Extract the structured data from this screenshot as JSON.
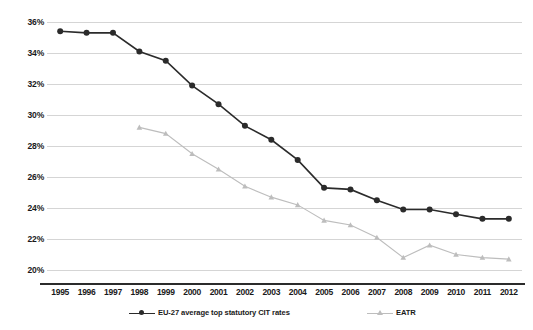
{
  "chart_data": {
    "type": "line",
    "title": "",
    "subtitle": "",
    "xlabel": "",
    "ylabel": "",
    "grid": true,
    "legend_position": "bottom",
    "ylim": [
      20,
      36
    ],
    "ytick_values": [
      36,
      34,
      32,
      30,
      28,
      26,
      24,
      22,
      20
    ],
    "ytick_labels": [
      "36%",
      "34%",
      "32%",
      "30%",
      "28%",
      "26%",
      "24%",
      "22%",
      "20%"
    ],
    "categories": [
      "1995",
      "1996",
      "1997",
      "1998",
      "1999",
      "2000",
      "2001",
      "2002",
      "2003",
      "2004",
      "2005",
      "2006",
      "2007",
      "2008",
      "2009",
      "2010",
      "2011",
      "2012"
    ],
    "series": [
      {
        "name": "EU-27 average top statutory CIT rates",
        "color": "#2b2b2b",
        "marker": "circle",
        "values": [
          35.4,
          35.3,
          35.3,
          34.1,
          33.5,
          31.9,
          30.7,
          29.3,
          28.4,
          27.1,
          25.3,
          25.2,
          24.5,
          23.9,
          23.9,
          23.6,
          23.3,
          23.3
        ]
      },
      {
        "name": "EATR",
        "color": "#bdbdbd",
        "marker": "triangle",
        "values": [
          null,
          null,
          null,
          29.2,
          28.8,
          27.5,
          26.5,
          25.4,
          24.7,
          24.2,
          23.2,
          22.9,
          22.1,
          20.8,
          21.6,
          21.0,
          20.8,
          20.7
        ]
      }
    ]
  },
  "legend": {
    "items": [
      {
        "label": "EU-27 average top statutory CIT rates"
      },
      {
        "label": "EATR"
      }
    ]
  }
}
